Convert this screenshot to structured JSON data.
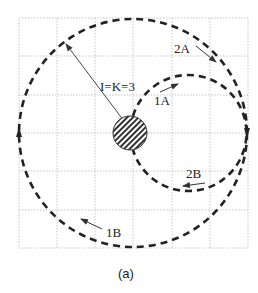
{
  "figure": {
    "caption": "(a)",
    "grid": {
      "rows": 6,
      "cols": 6,
      "left": 19,
      "top": 18,
      "right": 248,
      "bottom": 248,
      "line_color": "#b8b8b8"
    },
    "center_disk": {
      "cx": 130,
      "cy": 133,
      "r": 17,
      "fill": "#555555"
    },
    "radius_label": "I=K=3",
    "paths": [
      {
        "id": "large-circle",
        "cx": 133,
        "cy": 133,
        "r": 114
      },
      {
        "id": "small-circle",
        "cx": 190,
        "cy": 133,
        "r": 58
      }
    ],
    "labels": {
      "l1A": "1A",
      "l2A": "2A",
      "l1B": "1B",
      "l2B": "2B"
    },
    "colors": {
      "stroke": "#222222",
      "arrow": "#333333"
    }
  }
}
